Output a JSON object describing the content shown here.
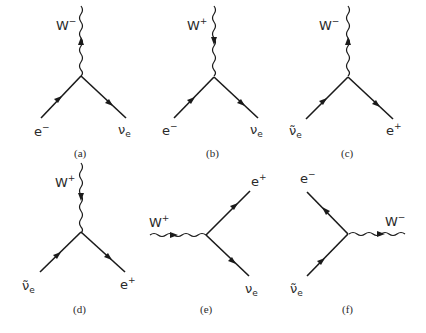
{
  "figure": {
    "diagrams": [
      {
        "id": "a",
        "caption": "(a)",
        "boson": {
          "label": "W",
          "charge": "−"
        },
        "incoming": {
          "label": "e",
          "charge": "−"
        },
        "outgoing": {
          "label": "ν",
          "subscript": "e"
        }
      },
      {
        "id": "b",
        "caption": "(b)",
        "boson": {
          "label": "W",
          "charge": "+"
        },
        "incoming": {
          "label": "e",
          "charge": "−"
        },
        "outgoing": {
          "label": "ν",
          "subscript": "e"
        }
      },
      {
        "id": "c",
        "caption": "(c)",
        "boson": {
          "label": "W",
          "charge": "−"
        },
        "incoming": {
          "label": "ν̃",
          "subscript": "e"
        },
        "outgoing": {
          "label": "e",
          "charge": "+"
        }
      },
      {
        "id": "d",
        "caption": "(d)",
        "boson": {
          "label": "W",
          "charge": "+"
        },
        "incoming": {
          "label": "ν̃",
          "subscript": "e"
        },
        "outgoing": {
          "label": "e",
          "charge": "+"
        }
      },
      {
        "id": "e",
        "caption": "(e)",
        "boson": {
          "label": "W",
          "charge": "+"
        },
        "upper": {
          "label": "e",
          "charge": "+"
        },
        "lower": {
          "label": "ν",
          "subscript": "e"
        }
      },
      {
        "id": "f",
        "caption": "(f)",
        "boson": {
          "label": "W",
          "charge": "−"
        },
        "upper": {
          "label": "e",
          "charge": "−"
        },
        "lower": {
          "label": "ν̃",
          "subscript": "e"
        }
      }
    ]
  }
}
